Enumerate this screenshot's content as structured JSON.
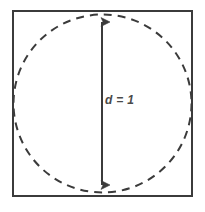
{
  "figure": {
    "background_color": "#ffffff"
  },
  "labels": {
    "diameter": "d = 1"
  },
  "chart_data": {
    "type": "diagram",
    "shapes": [
      {
        "name": "square",
        "kind": "rect",
        "x": 12,
        "y": 10,
        "width": 181,
        "height": 187,
        "stroke": "#3b3b3b",
        "stroke_width": 2,
        "fill": "none",
        "dashed": false
      },
      {
        "name": "inscribed-circle",
        "kind": "circle",
        "cx": 102.5,
        "cy": 103.5,
        "r": 89,
        "stroke": "#3b3b3b",
        "stroke_width": 2,
        "fill": "none",
        "dashed": true,
        "dash_pattern": "8 6"
      },
      {
        "name": "diameter-arrow",
        "kind": "double-arrow",
        "x": 102,
        "y1": 14,
        "y2": 193,
        "stroke": "#3b3b3b",
        "stroke_width": 2,
        "arrowheads": "both",
        "label": "d = 1"
      }
    ],
    "annotations": [
      {
        "text": "d = 1",
        "x": 105,
        "y": 100,
        "style": "italic",
        "color": "#4a4a4a"
      }
    ]
  },
  "colors": {
    "stroke": "#3b3b3b",
    "text": "#4a4a4a",
    "background": "#ffffff"
  }
}
